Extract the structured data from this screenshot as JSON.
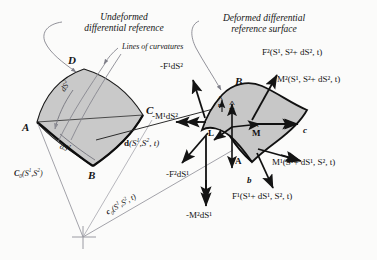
{
  "figure": {
    "type": "technical-diagram",
    "background_color": "#fbfbfa",
    "ink_color": "#141414",
    "surface_fill": "#c9c9c9",
    "leader_color": "#8c8c94"
  },
  "annotations": {
    "undeformed_title_line1": "Undeformed",
    "undeformed_title_line2": "differential reference",
    "deformed_title_line1": "Deformed differential",
    "deformed_title_line2": "reference surface",
    "lines_of_curvature": "Lines of curvatures"
  },
  "undeformed": {
    "vertices": [
      {
        "name": "A",
        "label": "A"
      },
      {
        "name": "B",
        "label": "B"
      },
      {
        "name": "C",
        "label": "C"
      },
      {
        "name": "D",
        "label": "D"
      }
    ],
    "arc_length_1": "dS",
    "arc_length_1_sup": "1",
    "arc_length_2": "dS",
    "arc_length_2_sup": "2"
  },
  "deformed": {
    "vertices": [
      {
        "name": "B",
        "label": "B"
      },
      {
        "name": "c",
        "label": "c"
      },
      {
        "name": "b",
        "label": "b"
      },
      {
        "name": "A",
        "label": "A"
      }
    ]
  },
  "position_vectors": {
    "undeformed_curve": "C",
    "undeformed_curve_sub": "0",
    "undeformed_curve_args": "(S",
    "undeformed_curve_sup1": "1",
    "undeformed_curve_mid": ",S",
    "undeformed_curve_sup2": "2",
    "undeformed_curve_close": ")",
    "deformed_curve": "c",
    "deformed_curve_sub": "0",
    "deformed_curve_args": "(S",
    "deformed_curve_sup1": "1",
    "deformed_curve_mid": ",S",
    "deformed_curve_sup2": "2",
    "deformed_curve_time": ", t)",
    "displacement": "d",
    "displacement_args": "(S",
    "displacement_sup1": "1",
    "displacement_mid": ",S",
    "displacement_sup2": "2",
    "displacement_time": ", t)"
  },
  "unit_vectors": [
    {
      "name": "f-hat",
      "label": "F",
      "hat": true
    },
    {
      "name": "m-hat",
      "label": "M",
      "hat": true
    },
    {
      "name": "l-vector",
      "label": "L",
      "hat": false
    },
    {
      "name": "a-vector",
      "label": "A",
      "hat": false
    },
    {
      "name": "n-hat",
      "label": "n",
      "hat": true
    }
  ],
  "resultants": [
    {
      "name": "neg-force-1",
      "symbol": "F",
      "superscript": "1",
      "prefix": "-",
      "suffix": "dS",
      "suffix_sup": "2",
      "text": "-F¹dS²",
      "arrow": "up-left"
    },
    {
      "name": "neg-moment-1",
      "symbol": "M",
      "superscript": "1",
      "prefix": "-",
      "suffix": "dS",
      "suffix_sup": "2",
      "text": "-M¹dS²",
      "arrow": "double-left"
    },
    {
      "name": "force-2-plus-ds2",
      "symbol": "F",
      "superscript": "2",
      "args": "(S¹, S²+ dS², t)",
      "text": "F²(S¹, S²+ dS², t)",
      "arrow": "up-right"
    },
    {
      "name": "moment-2-plus-ds2",
      "symbol": "M",
      "superscript": "2",
      "args": "(S¹, S²+ dS², t)",
      "text": "M²(S¹, S²+ dS², t)",
      "arrow": "double-right"
    },
    {
      "name": "moment-1-plus-ds1",
      "symbol": "M",
      "superscript": "1",
      "args": "(S¹+ dS¹, S², t)",
      "text": "M¹(S¹+ dS¹, S², t)",
      "arrow": "double-right-down"
    },
    {
      "name": "force-1-plus-ds1",
      "symbol": "F",
      "superscript": "1",
      "args": "(S¹+ dS¹, S², t)",
      "text": "F¹(S¹+ dS¹, S², t)",
      "arrow": "down-right"
    },
    {
      "name": "neg-force-2",
      "symbol": "F",
      "superscript": "2",
      "prefix": "-",
      "suffix": "dS",
      "suffix_sup": "1",
      "text": "-F²dS¹",
      "arrow": "down-left"
    },
    {
      "name": "neg-moment-2",
      "symbol": "M",
      "superscript": "2",
      "prefix": "-",
      "suffix": "dS",
      "suffix_sup": "1",
      "text": "-M²dS¹",
      "arrow": "double-down"
    }
  ],
  "origin_marker": {
    "name": "origin-cross",
    "shape": "cross"
  }
}
